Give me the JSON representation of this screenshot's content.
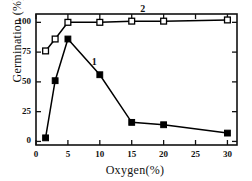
{
  "chart_data": {
    "type": "line",
    "title": "",
    "xlabel": "Oxygen(%)",
    "ylabel": "Germination (%)",
    "xlim": [
      0,
      31.5
    ],
    "ylim": [
      -3,
      107
    ],
    "xticks": [
      0,
      5,
      10,
      15,
      20,
      25,
      30
    ],
    "yticks": [
      0,
      25,
      50,
      75,
      100
    ],
    "grid": false,
    "legend_position": "inline-annotation",
    "frame": "box",
    "tick_direction": "in",
    "series": [
      {
        "name": "1",
        "label": "1",
        "marker": "filled-square",
        "color": "#000000",
        "points": [
          {
            "x": 1.5,
            "y": 3
          },
          {
            "x": 3,
            "y": 51
          },
          {
            "x": 5,
            "y": 86
          },
          {
            "x": 10,
            "y": 56
          },
          {
            "x": 15,
            "y": 16
          },
          {
            "x": 20,
            "y": 14
          },
          {
            "x": 30,
            "y": 7
          }
        ]
      },
      {
        "name": "2",
        "label": "2",
        "marker": "open-square",
        "color": "#000000",
        "points": [
          {
            "x": 1.5,
            "y": 76
          },
          {
            "x": 3,
            "y": 86
          },
          {
            "x": 5,
            "y": 100
          },
          {
            "x": 10,
            "y": 100
          },
          {
            "x": 15,
            "y": 101
          },
          {
            "x": 20,
            "y": 101
          },
          {
            "x": 30,
            "y": 102
          }
        ]
      }
    ],
    "annotations": [
      {
        "text": "1",
        "x": 9.2,
        "y": 66
      },
      {
        "text": "2",
        "x": 16.8,
        "y": 110
      }
    ]
  },
  "axis": {
    "ytick_labels": [
      "0",
      "25",
      "50",
      "75",
      "100"
    ],
    "xtick_labels": [
      "0",
      "5",
      "10",
      "15",
      "20",
      "25",
      "30"
    ]
  }
}
